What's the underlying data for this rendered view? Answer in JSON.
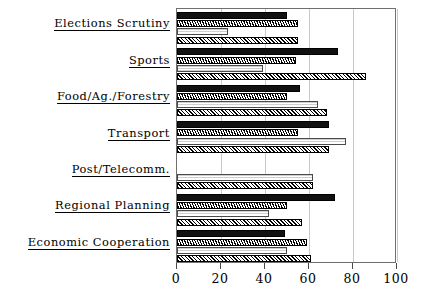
{
  "chart_data": {
    "type": "bar",
    "orientation": "horizontal",
    "title": "",
    "xlabel": "",
    "ylabel": "",
    "xlim": [
      0,
      100
    ],
    "ylim": null,
    "grid": true,
    "grid_axis": "x",
    "legend": null,
    "legend_position": "none",
    "xticks": [
      0,
      20,
      40,
      60,
      80,
      100
    ],
    "xticklabels": [
      "0",
      "20",
      "40",
      "60",
      "80",
      "100"
    ],
    "categories": [
      "Elections Scrutiny",
      "Sports",
      "Food/Ag./Forestry",
      "Transport",
      "Post/Telecomm.",
      "Regional Planning",
      "Economic Cooperation"
    ],
    "series": [
      {
        "name": "series-1",
        "pattern": "solid-black",
        "values": [
          50,
          73,
          56,
          69,
          0,
          72,
          49
        ]
      },
      {
        "name": "series-2",
        "pattern": "dense-cross-hatch",
        "values": [
          55,
          54,
          50,
          55,
          0,
          50,
          59
        ]
      },
      {
        "name": "series-3",
        "pattern": "light-dotted",
        "values": [
          23,
          39,
          64,
          77,
          62,
          42,
          50
        ]
      },
      {
        "name": "series-4",
        "pattern": "diagonal-hatch",
        "values": [
          55,
          86,
          68,
          69,
          62,
          57,
          61
        ]
      }
    ]
  },
  "axis": {
    "ticks": [
      {
        "value": 0,
        "label": "0"
      },
      {
        "value": 20,
        "label": "20"
      },
      {
        "value": 40,
        "label": "40"
      },
      {
        "value": 60,
        "label": "60"
      },
      {
        "value": 80,
        "label": "80"
      },
      {
        "value": 100,
        "label": "100"
      }
    ]
  },
  "labels": {
    "items": [
      {
        "text": "Elections Scrutiny"
      },
      {
        "text": "Sports"
      },
      {
        "text": "Food/Ag./Forestry"
      },
      {
        "text": "Transport"
      },
      {
        "text": "Post/Telecomm."
      },
      {
        "text": "Regional Planning"
      },
      {
        "text": "Economic Cooperation"
      }
    ]
  },
  "colors": {
    "series_1": "#111111",
    "series_2": "#000000",
    "series_3": "#cfcfcf",
    "series_4": "#000000",
    "frame": "#6f6f6f",
    "grid": "#c9c9c9",
    "text": "#000000",
    "background": "#ffffff"
  }
}
